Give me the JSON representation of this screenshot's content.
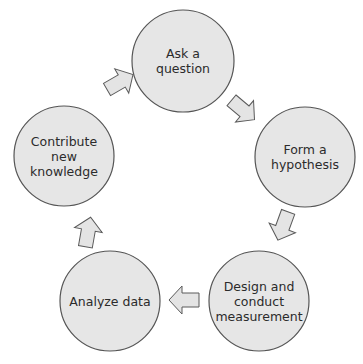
{
  "diagram": {
    "type": "cycle",
    "colors": {
      "node_fill": "#e6e6e6",
      "node_stroke": "#555555",
      "arrow_fill": "#e4e4e4",
      "arrow_stroke": "#5a5a5a",
      "text": "#2b2b2b",
      "background": "#ffffff"
    },
    "nodes": [
      {
        "id": "ask",
        "label": "Ask a\nquestion",
        "cx": 183,
        "cy": 61,
        "r": 51
      },
      {
        "id": "hypothesis",
        "label": "Form a\nhypothesis",
        "cx": 305,
        "cy": 157,
        "r": 50
      },
      {
        "id": "measure",
        "label": "Design and\nconduct\nmeasurement",
        "cx": 259,
        "cy": 301,
        "r": 50
      },
      {
        "id": "analyze",
        "label": "Analyze data",
        "cx": 110,
        "cy": 301,
        "r": 50
      },
      {
        "id": "contribute",
        "label": "Contribute\nnew\nknowledge",
        "cx": 64,
        "cy": 156,
        "r": 50
      }
    ],
    "edges": [
      {
        "from": "ask",
        "to": "hypothesis",
        "direction": "down-right"
      },
      {
        "from": "hypothesis",
        "to": "measure",
        "direction": "down-left"
      },
      {
        "from": "measure",
        "to": "analyze",
        "direction": "left"
      },
      {
        "from": "analyze",
        "to": "contribute",
        "direction": "up"
      },
      {
        "from": "contribute",
        "to": "ask",
        "direction": "up-right"
      }
    ]
  }
}
